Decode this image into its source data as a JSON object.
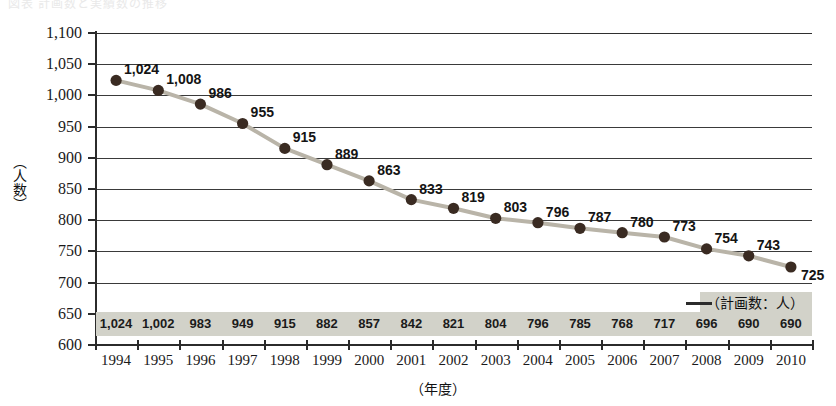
{
  "page": {
    "top_fragment": "図表 計画数と実績数の推移"
  },
  "chart_data": {
    "type": "line",
    "title": "",
    "xlabel": "（年度）",
    "ylabel": "（人数）",
    "categories": [
      "1994",
      "1995",
      "1996",
      "1997",
      "1998",
      "1999",
      "2000",
      "2001",
      "2002",
      "2003",
      "2004",
      "2005",
      "2006",
      "2007",
      "2008",
      "2009",
      "2010"
    ],
    "values": [
      1024,
      1008,
      986,
      955,
      915,
      889,
      863,
      833,
      819,
      803,
      796,
      787,
      780,
      773,
      754,
      743,
      725
    ],
    "point_labels": [
      "1,024",
      "1,008",
      "986",
      "955",
      "915",
      "889",
      "863",
      "833",
      "819",
      "803",
      "796",
      "787",
      "780",
      "773",
      "754",
      "743",
      "725"
    ],
    "ylim": [
      600,
      1100
    ],
    "ytick_step": 50,
    "ytick_labels": [
      "1,100",
      "1,050",
      "1,000",
      "950",
      "900",
      "850",
      "800",
      "750",
      "700",
      "650",
      "600"
    ],
    "ytick_values": [
      1100,
      1050,
      1000,
      950,
      900,
      850,
      800,
      750,
      700,
      650,
      600
    ],
    "grid": true,
    "legend_position": "bottom-right",
    "legend": "（計画数：人）",
    "table": {
      "label": "（計画数：人）",
      "values": [
        "1,024",
        "1,002",
        "983",
        "949",
        "915",
        "882",
        "857",
        "842",
        "821",
        "804",
        "796",
        "785",
        "768",
        "717",
        "696",
        "690",
        "690"
      ]
    },
    "colors": {
      "line": "#b9b4a8",
      "marker": "#3a2b22",
      "grid": "#2f2f2f",
      "axis": "#2b2b2b",
      "table_band": "#d2d2c9"
    }
  }
}
